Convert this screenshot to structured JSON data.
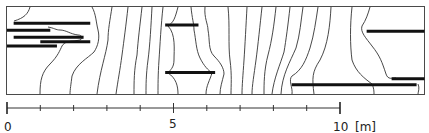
{
  "figure": {
    "colors": {
      "line": "#333333",
      "crack": "#111111",
      "background": "#ffffff"
    }
  },
  "scale_bar": {
    "unit_label": "[m]",
    "min": 0,
    "max": 10,
    "minor_step": 1,
    "labels": [
      {
        "value": 0,
        "text": "0"
      },
      {
        "value": 5,
        "text": "5"
      },
      {
        "value": 10,
        "text": "10"
      }
    ]
  },
  "cracks": [
    {
      "x_start_m": 0.2,
      "x_end_m": 2.5,
      "y_rel": 0.19,
      "name": "crack-left-1"
    },
    {
      "x_start_m": 0.0,
      "x_end_m": 1.3,
      "y_rel": 0.27,
      "name": "crack-left-2"
    },
    {
      "x_start_m": 0.2,
      "x_end_m": 2.3,
      "y_rel": 0.35,
      "name": "crack-left-3"
    },
    {
      "x_start_m": 1.0,
      "x_end_m": 2.5,
      "y_rel": 0.4,
      "name": "crack-left-4"
    },
    {
      "x_start_m": 0.0,
      "x_end_m": 1.5,
      "y_rel": 0.45,
      "name": "crack-left-5"
    },
    {
      "x_start_m": 4.75,
      "x_end_m": 5.75,
      "y_rel": 0.21,
      "name": "crack-middle-1"
    },
    {
      "x_start_m": 4.75,
      "x_end_m": 6.25,
      "y_rel": 0.75,
      "name": "crack-middle-2"
    },
    {
      "x_start_m": 10.8,
      "x_end_m": 12.55,
      "y_rel": 0.28,
      "name": "crack-right-1"
    },
    {
      "x_start_m": 11.55,
      "x_end_m": 12.55,
      "y_rel": 0.82,
      "name": "crack-right-2"
    },
    {
      "x_start_m": 8.55,
      "x_end_m": 12.3,
      "y_rel": 0.89,
      "name": "crack-right-3"
    }
  ]
}
